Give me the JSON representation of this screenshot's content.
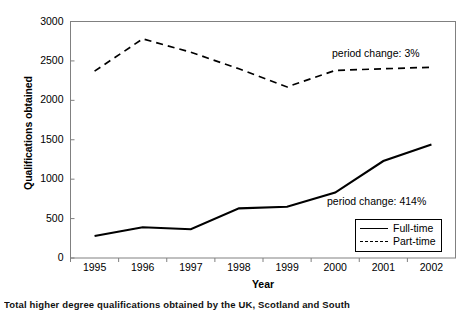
{
  "chart_data": {
    "type": "line",
    "title": "",
    "xlabel": "Year",
    "ylabel": "Qualifications obtained",
    "categories": [
      "1995",
      "1996",
      "1997",
      "1998",
      "1999",
      "2000",
      "2001",
      "2002"
    ],
    "x": [
      1995,
      1996,
      1997,
      1998,
      1999,
      2000,
      2001,
      2002
    ],
    "ylim": [
      0,
      3000
    ],
    "yticks": [
      "0",
      "500",
      "1000",
      "1500",
      "2000",
      "2500",
      "3000"
    ],
    "ytick_values": [
      0,
      500,
      1000,
      1500,
      2000,
      2500,
      3000
    ],
    "grid": false,
    "legend_position": "bottom-right",
    "series": [
      {
        "name": "Full-time",
        "style": "solid",
        "color": "#000000",
        "values": [
          280,
          390,
          365,
          630,
          650,
          830,
          1230,
          1440
        ]
      },
      {
        "name": "Part-time",
        "style": "dashed",
        "color": "#000000",
        "values": [
          2370,
          2780,
          2610,
          2400,
          2170,
          2380,
          2400,
          2420
        ]
      }
    ],
    "annotations": [
      {
        "text": "period change: 3%",
        "series": "Part-time"
      },
      {
        "text": "period change: 414%",
        "series": "Full-time"
      }
    ]
  },
  "legend": {
    "entries": [
      {
        "label": "Full-time",
        "style": "solid"
      },
      {
        "label": "Part-time",
        "style": "dashed"
      }
    ]
  },
  "caption": {
    "text": "Total higher degree qualifications obtained by the UK, Scotland and South"
  }
}
